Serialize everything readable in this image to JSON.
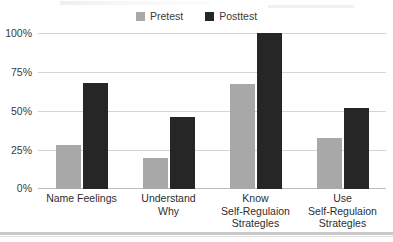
{
  "chart_data": {
    "type": "bar",
    "title": "",
    "subtitle": "",
    "xlabel": "",
    "ylabel": "",
    "ylim": [
      0,
      100
    ],
    "yticks": [
      "0%",
      "25%",
      "50%",
      "75%",
      "100%"
    ],
    "ytick_values": [
      0,
      25,
      50,
      75,
      100
    ],
    "grid": true,
    "legend_position": "top-center",
    "categories": [
      "Name Feelings",
      "Understand\nWhy",
      "Know\nSelf-Regulaion\nStrategles",
      "Use\nSelf-Regulaion\nStrategles"
    ],
    "category_lines": [
      [
        "Name Feelings"
      ],
      [
        "Understand",
        "Why"
      ],
      [
        "Know",
        "Self-Regulaion",
        "Strategles"
      ],
      [
        "Use",
        "Self-Regulaion",
        "Strategles"
      ]
    ],
    "series": [
      {
        "name": "Pretest",
        "color": "#a8a8a8",
        "values": [
          28,
          20,
          67,
          33
        ]
      },
      {
        "name": "Posttest",
        "color": "#262626",
        "values": [
          68,
          46,
          100,
          52
        ]
      }
    ]
  },
  "legend": {
    "items": [
      {
        "label": "Pretest",
        "swatch_icon": "square-swatch-icon",
        "color": "#a8a8a8"
      },
      {
        "label": "Posttest",
        "swatch_icon": "square-swatch-icon",
        "color": "#262626"
      }
    ]
  },
  "axes": {
    "y": {
      "ticks": [
        "100%",
        "75%",
        "50%",
        "25%",
        "0%"
      ]
    }
  }
}
